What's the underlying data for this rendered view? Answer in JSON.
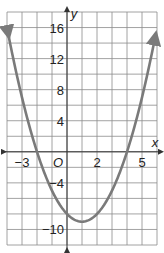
{
  "chart_data": {
    "type": "line",
    "title": "",
    "xlabel": "x",
    "ylabel": "y",
    "origin_label": "O",
    "xlim": [
      -4,
      6
    ],
    "ylim": [
      -12,
      18
    ],
    "grid": true,
    "x_grid_step": 1,
    "y_grid_step": 2,
    "x_tick_labels": [
      {
        "value": -3,
        "label": "−3"
      },
      {
        "value": 2,
        "label": "2"
      },
      {
        "value": 5,
        "label": "5"
      }
    ],
    "y_tick_labels": [
      {
        "value": 16,
        "label": "16"
      },
      {
        "value": 12,
        "label": "12"
      },
      {
        "value": 8,
        "label": "8"
      },
      {
        "value": 4,
        "label": "4"
      },
      {
        "value": -4,
        "label": "−4"
      },
      {
        "value": -10,
        "label": "−10"
      }
    ],
    "series": [
      {
        "name": "parabola",
        "equation": "y = x^2 - 2x - 8",
        "color": "#7a7a7a",
        "x": [
          -3.9,
          -3,
          -2,
          -1,
          0,
          1,
          2,
          3,
          4,
          5,
          5.9
        ],
        "y": [
          15.0,
          7,
          0,
          -5,
          -8,
          -9,
          -8,
          -5,
          0,
          7,
          15.0
        ],
        "vertex": [
          1,
          -9
        ],
        "x_intercepts": [
          -2,
          4
        ],
        "y_intercept": -8,
        "arrows_at_ends": true
      }
    ]
  },
  "colors": {
    "grid": "#8c8c8c",
    "axis": "#333333",
    "curve": "#7a7a7a",
    "background": "#ffffff"
  }
}
